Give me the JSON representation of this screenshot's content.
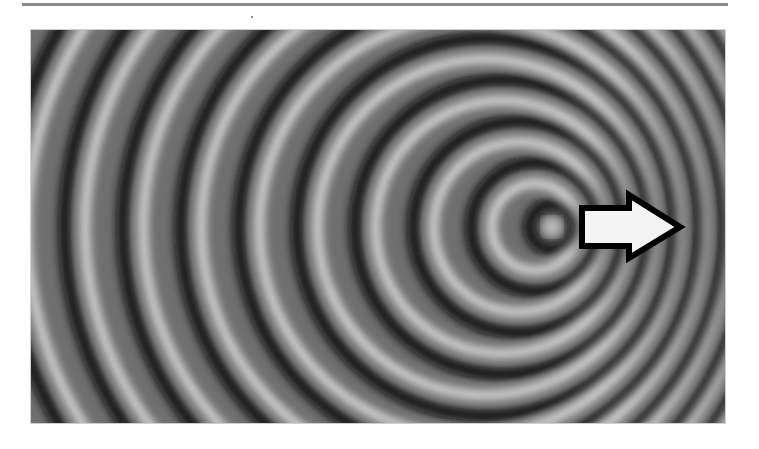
{
  "figure": {
    "width": 694,
    "height": 393,
    "source": {
      "cx": 521,
      "cy": 197
    },
    "wavelength": 41.5,
    "speed_ratio": 0.4,
    "ring_count": 22,
    "colors": {
      "dark": "#0a0a0a",
      "light": "#e6e6e6",
      "mid": "#6f6f6f"
    },
    "arrow": {
      "direction": "right",
      "fill": "#f4f4f4",
      "stroke": "#000000",
      "points": "551,178 598,178 598,165 649,197 598,228 598,216 551,216"
    }
  }
}
